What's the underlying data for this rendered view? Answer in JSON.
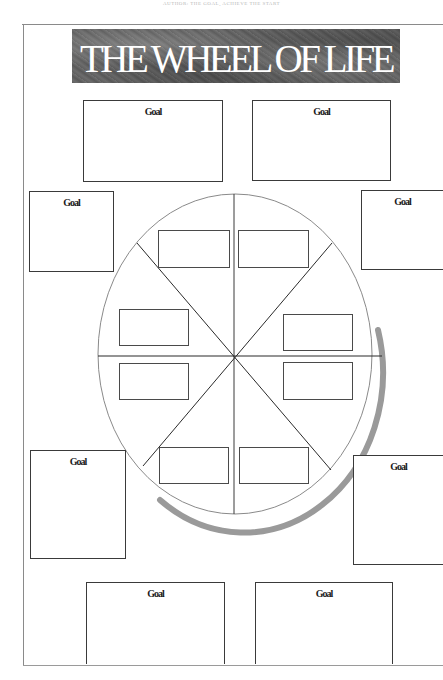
{
  "document": {
    "header_note": "AUTHOR: THE GOAL, ACHIEVE THE START",
    "title": "THE WHEEL OF LIFE"
  },
  "goals": [
    {
      "id": "goal-top-left",
      "label": "Goal"
    },
    {
      "id": "goal-top-right",
      "label": "Goal"
    },
    {
      "id": "goal-middle-left",
      "label": "Goal"
    },
    {
      "id": "goal-middle-right",
      "label": "Goal"
    },
    {
      "id": "goal-lower-left",
      "label": "Goal"
    },
    {
      "id": "goal-lower-right",
      "label": "Goal"
    },
    {
      "id": "goal-bottom-left",
      "label": "Goal"
    },
    {
      "id": "goal-bottom-right",
      "label": "Goal"
    }
  ],
  "wheel": {
    "segments": 8,
    "segment_boxes": [
      {
        "id": "segment-top-left",
        "value": ""
      },
      {
        "id": "segment-top-right",
        "value": ""
      },
      {
        "id": "segment-upper-left",
        "value": ""
      },
      {
        "id": "segment-upper-right",
        "value": ""
      },
      {
        "id": "segment-lower-left",
        "value": ""
      },
      {
        "id": "segment-lower-right",
        "value": ""
      },
      {
        "id": "segment-bottom-left",
        "value": ""
      },
      {
        "id": "segment-bottom-right",
        "value": ""
      }
    ],
    "colors": {
      "outline": "#8a8a8a",
      "shadow": "#9a9a9a",
      "spokes": "#2a2a2a"
    }
  },
  "colors": {
    "banner_background": "#636363",
    "banner_text": "#ffffff",
    "box_border": "#3a3a3a",
    "page_border": "#8a8a8a"
  }
}
